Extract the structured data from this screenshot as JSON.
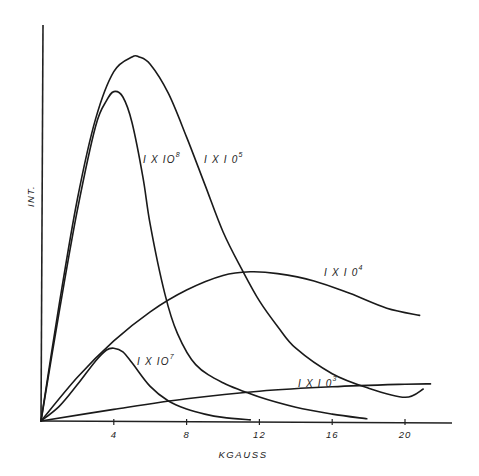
{
  "chart_data": {
    "type": "line",
    "title": "",
    "xlabel": "KGAUSS",
    "ylabel": "INT.",
    "xlim": [
      0,
      22.6
    ],
    "ylim": [
      0,
      108
    ],
    "x_ticks": [
      4,
      8,
      12,
      16,
      20
    ],
    "x_tick_labels": [
      "4",
      "8",
      "12",
      "16",
      "20"
    ],
    "y_ticks": [],
    "grid": false,
    "legend": "inline labels on curves",
    "y_units_note": "relative intensity, arbitrary (peak of 1 X 10^5 curve normalized to 100)",
    "series": [
      {
        "name": "1 X 10^8",
        "label": "I X 10",
        "exponent": "8",
        "x": [
          0,
          1,
          2,
          3,
          3.6,
          4.0,
          4.5,
          5.0,
          5.6,
          6.0,
          6.8,
          7.5,
          8.5,
          10.0,
          12.0,
          14.0,
          16.0,
          17.9
        ],
        "y": [
          0,
          30,
          58,
          81,
          88,
          90.5,
          89,
          82,
          67,
          54,
          35,
          24,
          15.5,
          10.5,
          6.6,
          3.8,
          1.9,
          0.6
        ]
      },
      {
        "name": "1 X 10^5",
        "label": "I X I 0",
        "exponent": "5",
        "x": [
          0,
          1,
          2,
          3,
          4,
          5.0,
          5.4,
          6.0,
          7.0,
          8.0,
          9.0,
          10.0,
          11.0,
          12.0,
          13.0,
          14.0,
          16.0,
          18.0,
          20.0,
          21.0
        ],
        "y": [
          0,
          32,
          61,
          83,
          96,
          100,
          100,
          98,
          90,
          78,
          65,
          52,
          42,
          33,
          26,
          20,
          13,
          9,
          6.5,
          8.8
        ]
      },
      {
        "name": "1 X 10^4",
        "label": "I X I 0",
        "exponent": "4",
        "x": [
          0,
          2,
          4,
          6,
          8,
          10,
          11.5,
          13,
          15,
          17,
          19,
          20.8
        ],
        "y": [
          0,
          12,
          22,
          30,
          36,
          40,
          41,
          40.5,
          38.5,
          35,
          31,
          29
        ]
      },
      {
        "name": "1 X 10^7",
        "label": "I X 10",
        "exponent": "7",
        "x": [
          0,
          1,
          2,
          3,
          3.6,
          4.0,
          4.5,
          5.0,
          6.0,
          7.0,
          8.0,
          9.0,
          10.0,
          11.5
        ],
        "y": [
          0,
          4,
          10,
          16.5,
          19.5,
          20,
          19,
          16,
          9.5,
          5.5,
          3.3,
          1.9,
          1.0,
          0.3
        ]
      },
      {
        "name": "1 X 10^3",
        "label": "I X I 0",
        "exponent": "3",
        "x": [
          0,
          4,
          8,
          12,
          16,
          20,
          21.4
        ],
        "y": [
          0,
          3.2,
          6.1,
          8.2,
          9.4,
          10.1,
          10.2
        ]
      }
    ]
  },
  "axes": {
    "x_label": "KGAUSS",
    "y_label": "INT.",
    "x_tick_labels": [
      "4",
      "8",
      "12",
      "16",
      "20"
    ]
  },
  "labels": {
    "s8": {
      "base": "I X IO",
      "exp": "8"
    },
    "s5": {
      "base": "I X I 0",
      "exp": "5"
    },
    "s4": {
      "base": "I X I 0",
      "exp": "4"
    },
    "s7": {
      "base": "I X IO",
      "exp": "7"
    },
    "s3": {
      "base": "I X I 0",
      "exp": "3"
    }
  }
}
